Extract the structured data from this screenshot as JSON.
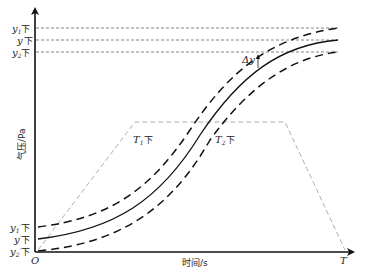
{
  "diagram": {
    "y_axis_label": "气压/Pa",
    "x_axis_label": "时间/s",
    "origin_label": "O",
    "x_end_label": "T",
    "top_labels": [
      {
        "var": "y",
        "sub": "1",
        "suffix": "下"
      },
      {
        "var": "y",
        "sub": "",
        "suffix": "下"
      },
      {
        "var": "y",
        "sub": "2",
        "suffix": "下"
      }
    ],
    "bottom_labels": [
      {
        "var": "y",
        "sub": "1",
        "prime": "′",
        "suffix": "下"
      },
      {
        "var": "y",
        "sub": "",
        "prime": "′",
        "suffix": "下"
      },
      {
        "var": "y",
        "sub": "2",
        "prime": "′",
        "suffix": "下"
      }
    ],
    "t1_label": {
      "var": "T",
      "sub": "1",
      "suffix": "下"
    },
    "t2_label": {
      "var": "T",
      "sub": "2",
      "suffix": "下"
    },
    "delta_label": "Δy",
    "colors": {
      "axis": "#111111",
      "curve": "#111111",
      "guide": "#555555",
      "trapezoid": "#999999"
    }
  }
}
